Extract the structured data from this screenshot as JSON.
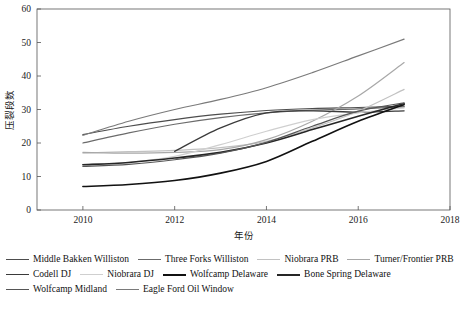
{
  "chart_data": {
    "type": "line",
    "title": "",
    "xlabel": "年份",
    "ylabel": "压裂段数",
    "xlim": [
      2009,
      2018
    ],
    "ylim": [
      0,
      60
    ],
    "xticks": [
      2010,
      2012,
      2014,
      2016,
      2018
    ],
    "yticks": [
      0,
      10,
      20,
      30,
      40,
      50,
      60
    ],
    "grid": false,
    "legend_position": "below",
    "x": [
      2010,
      2011,
      2012,
      2013,
      2014,
      2015,
      2016,
      2017
    ],
    "series": [
      {
        "name": "Middle Bakken Williston",
        "color": "#4d4d4d",
        "width": 1.2,
        "values": [
          22.5,
          25.0,
          27.0,
          28.6,
          29.7,
          30.3,
          30.6,
          31.0
        ]
      },
      {
        "name": "Three Forks Williston",
        "color": "#6b6b6b",
        "width": 1.2,
        "values": [
          20.0,
          23.0,
          25.6,
          27.6,
          29.0,
          29.8,
          30.2,
          30.8
        ]
      },
      {
        "name": "Niobrara PRB",
        "color": "#c2c2c2",
        "width": 1.2,
        "values": [
          17.0,
          17.4,
          17.8,
          18.6,
          20.5,
          24.5,
          29.5,
          36.0
        ]
      },
      {
        "name": "Turner/Frontier PRB",
        "color": "#a8a8a8",
        "width": 1.2,
        "values": [
          17.2,
          17.0,
          17.2,
          18.0,
          21.0,
          26.5,
          34.0,
          44.0
        ]
      },
      {
        "name": "Codell DJ",
        "color": "#3a3a3a",
        "width": 1.3,
        "values": [
          null,
          null,
          17.5,
          24.5,
          29.0,
          29.6,
          29.2,
          29.6
        ]
      },
      {
        "name": "Niobrara DJ",
        "color": "#cfcfcf",
        "width": 1.2,
        "values": [
          13.6,
          14.2,
          16.0,
          19.5,
          23.5,
          27.0,
          29.0,
          30.5
        ]
      },
      {
        "name": "Wolfcamp Delaware",
        "color": "#111111",
        "width": 1.6,
        "values": [
          7.0,
          7.6,
          8.8,
          11.0,
          14.5,
          20.5,
          26.5,
          31.5
        ]
      },
      {
        "name": "Bone Spring Delaware",
        "color": "#262626",
        "width": 1.6,
        "values": [
          13.5,
          14.2,
          15.5,
          17.2,
          20.0,
          24.0,
          28.0,
          31.8
        ]
      },
      {
        "name": "Wolfcamp Midland",
        "color": "#555555",
        "width": 1.2,
        "values": [
          13.0,
          13.6,
          15.0,
          17.0,
          20.2,
          25.0,
          29.5,
          32.0
        ]
      },
      {
        "name": "Eagle Ford Oil Window",
        "color": "#7a7a7a",
        "width": 1.2,
        "values": [
          22.3,
          26.5,
          30.0,
          33.0,
          36.5,
          41.0,
          46.0,
          51.0
        ]
      }
    ]
  },
  "legend": {
    "rows": [
      [
        {
          "label": "Middle Bakken Williston",
          "color": "#4d4d4d",
          "width": 1.4
        },
        {
          "label": "Three Forks Williston",
          "color": "#6b6b6b",
          "width": 1.4
        },
        {
          "label": "Niobrara PRB",
          "color": "#c2c2c2",
          "width": 1.4
        },
        {
          "label": "Turner/Frontier PRB",
          "color": "#a8a8a8",
          "width": 1.4
        }
      ],
      [
        {
          "label": "Codell DJ",
          "color": "#3a3a3a",
          "width": 1.6
        },
        {
          "label": "Niobrara DJ",
          "color": "#cfcfcf",
          "width": 1.4
        },
        {
          "label": "Wolfcamp Delaware",
          "color": "#111111",
          "width": 2.0
        },
        {
          "label": "Bone Spring Delaware",
          "color": "#262626",
          "width": 2.0
        }
      ],
      [
        {
          "label": "Wolfcamp Midland",
          "color": "#555555",
          "width": 1.4
        },
        {
          "label": "Eagle Ford Oil Window",
          "color": "#7a7a7a",
          "width": 1.4
        }
      ]
    ]
  }
}
